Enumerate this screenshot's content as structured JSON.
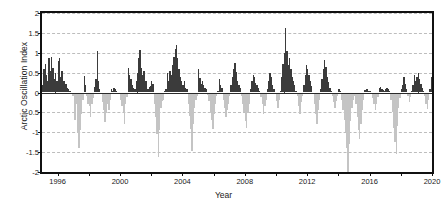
{
  "chart_data": {
    "type": "bar",
    "title": "",
    "xlabel": "Year",
    "ylabel": "Arctic Oscillation Index",
    "xlim": [
      1995.0,
      2020.0
    ],
    "ylim": [
      -2,
      2
    ],
    "grid": true,
    "legend": "none",
    "series_name": "Arctic Oscillation Index (monthly)",
    "positive_color": "#3b3b3b",
    "negative_color": "#c4c4c4",
    "ytick_labels": [
      "2",
      "1.5",
      "1",
      "0.5",
      "0",
      "-0.5",
      "-1",
      "-1.5",
      "-2"
    ],
    "ytick_values": [
      2,
      1.5,
      1,
      0.5,
      0,
      -0.5,
      -1,
      -1.5,
      -2
    ],
    "xtick_labels": [
      "1996",
      "2000",
      "2004",
      "2008",
      "2012",
      "2016",
      "2020"
    ],
    "xtick_values": [
      1996,
      2000,
      2004,
      2008,
      2012,
      2016,
      2020
    ],
    "xtick_minor_values": [
      1998,
      2002,
      2006,
      2010,
      2014,
      2018
    ],
    "x_start": 1995.0,
    "x_step": 0.0833333,
    "values": [
      0.18,
      0.6,
      0.72,
      0.45,
      0.3,
      0.88,
      0.55,
      0.9,
      0.62,
      0.35,
      0.5,
      0.3,
      0.8,
      0.86,
      0.4,
      0.55,
      0.28,
      0.3,
      0.22,
      0.12,
      0.1,
      0.05,
      -0.05,
      -0.08,
      -0.1,
      -0.68,
      -0.3,
      -1.02,
      -1.4,
      -0.95,
      -0.55,
      -0.2,
      0.42,
      0.2,
      -0.1,
      -0.28,
      -0.35,
      -0.62,
      -0.3,
      -0.15,
      0.15,
      0.35,
      1.04,
      0.3,
      0.1,
      -0.05,
      -0.25,
      -0.45,
      -0.75,
      -0.52,
      -0.3,
      -0.45,
      -0.2,
      0.08,
      0.05,
      0.12,
      0.08,
      0.04,
      -0.02,
      -0.05,
      -0.2,
      -0.35,
      -0.5,
      -0.78,
      -0.3,
      -0.12,
      0.62,
      0.45,
      0.34,
      0.2,
      0.12,
      0.08,
      0.3,
      0.5,
      0.88,
      1.08,
      0.62,
      0.44,
      0.55,
      0.3,
      0.28,
      0.1,
      0.14,
      0.16,
      0.3,
      0.22,
      -0.3,
      -0.62,
      -1.05,
      -1.63,
      -0.95,
      -0.4,
      -0.22,
      -0.18,
      0.05,
      0.1,
      0.48,
      0.3,
      0.55,
      0.45,
      0.7,
      0.9,
      1.1,
      1.2,
      0.86,
      0.6,
      0.4,
      0.28,
      0.18,
      0.3,
      0.12,
      0.1,
      -0.28,
      -0.6,
      -0.92,
      -1.48,
      -0.8,
      -0.4,
      -0.2,
      -0.1,
      0.58,
      0.36,
      0.22,
      0.3,
      0.2,
      0.12,
      0.08,
      -0.06,
      -0.22,
      -0.48,
      -0.7,
      -0.92,
      -0.55,
      -0.28,
      -0.1,
      0.05,
      0.34,
      0.2,
      0.12,
      -0.18,
      -0.4,
      -0.62,
      -0.45,
      -0.28,
      -0.1,
      0.2,
      0.4,
      0.58,
      0.74,
      0.52,
      0.3,
      0.2,
      0.12,
      -0.1,
      -0.3,
      -0.48,
      -0.72,
      -0.9,
      -0.52,
      -0.28,
      0.1,
      0.3,
      0.45,
      0.4,
      0.24,
      0.18,
      0.12,
      0.05,
      -0.12,
      -0.3,
      -0.55,
      -0.35,
      -0.2,
      0.1,
      0.28,
      0.48,
      0.38,
      0.2,
      0.1,
      -0.05,
      -0.22,
      -0.38,
      -0.18,
      0.05,
      0.4,
      0.72,
      1.0,
      1.62,
      1.05,
      0.7,
      0.88,
      0.6,
      0.4,
      0.3,
      0.18,
      0.05,
      -0.1,
      -0.35,
      -0.55,
      -0.25,
      -0.08,
      0.2,
      0.45,
      0.7,
      0.6,
      0.44,
      0.3,
      0.16,
      -0.05,
      -0.3,
      -0.55,
      -0.78,
      -0.45,
      -0.2,
      0.1,
      0.34,
      0.58,
      0.82,
      0.65,
      0.4,
      0.26,
      0.12,
      0.05,
      -0.1,
      -0.25,
      -0.4,
      -0.22,
      -0.08,
      0.1,
      0.05,
      -0.2,
      -0.45,
      -0.7,
      -1.0,
      -1.4,
      -2.03,
      -1.3,
      -0.72,
      -0.4,
      -0.18,
      -0.1,
      -0.3,
      -0.62,
      -0.95,
      -1.18,
      -0.8,
      -0.45,
      -0.2,
      0.06,
      0.1,
      0.08,
      0.05,
      0.04,
      -0.05,
      -0.15,
      -0.28,
      -0.45,
      -0.3,
      -0.12,
      0.12,
      0.14,
      0.1,
      0.06,
      0.04,
      0.08,
      0.12,
      0.1,
      0.05,
      -0.2,
      -0.5,
      -0.9,
      -1.25,
      -1.55,
      -0.85,
      -0.4,
      -0.15,
      0.08,
      0.2,
      0.38,
      0.22,
      0.1,
      -0.08,
      -0.25,
      -0.12,
      0.05,
      0.18,
      0.45,
      0.3,
      0.4,
      0.5,
      0.35,
      0.22,
      0.12,
      0.05,
      -0.1,
      -0.28,
      -0.42,
      -0.2,
      0.1,
      0.4,
      0.8,
      1.32,
      1.22,
      0.78,
      0.5,
      0.3,
      0.18,
      0.06,
      -0.12,
      -0.3,
      -0.18,
      0.08,
      0.3,
      0.55,
      0.8,
      1.05,
      1.38,
      1.3,
      0.92,
      0.64,
      0.42,
      0.26,
      0.12,
      0.05,
      -0.1,
      -0.22,
      -0.1,
      0.12,
      0.36,
      0.62,
      1.1,
      0.8,
      0.52,
      0.34,
      0.2,
      0.1,
      0.05,
      -0.12,
      -0.3,
      -0.6,
      -0.35,
      -0.15,
      0.1,
      0.3,
      0.55,
      0.72,
      0.52,
      0.35,
      0.22,
      0.1,
      0.05,
      -0.08,
      -0.2,
      -0.45,
      -0.28,
      -0.1,
      0.2,
      0.45,
      0.68,
      1.02,
      0.75,
      0.5,
      0.32,
      0.2,
      0.12,
      0.05,
      0.2,
      0.26,
      0.18,
      0.1,
      0.05,
      -0.05,
      -0.12,
      0.05,
      0.18,
      0.4,
      0.7,
      0.9,
      1.0,
      0.66,
      0.45,
      0.3,
      0.18,
      0.1,
      0.06,
      -0.1,
      -0.3,
      -0.52,
      -0.2,
      0.12,
      0.35,
      0.58,
      0.72,
      0.5,
      0.3,
      0.2,
      0.12,
      0.05,
      0.22,
      0.3,
      1.04,
      0.7,
      0.44,
      0.28,
      0.16,
      0.08,
      -0.1,
      -0.35,
      -0.6,
      -0.78,
      -0.42,
      -0.18,
      0.1,
      0.3,
      0.45,
      0.62,
      0.4,
      0.25,
      0.14,
      0.12
    ]
  },
  "figure": {
    "bottom_artifact": ""
  }
}
